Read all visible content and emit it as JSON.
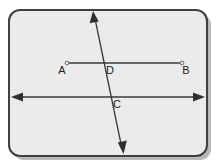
{
  "figure": {
    "kind": "geometry-diagram",
    "background_color": "#ffffff",
    "plate_fill": "#ebebeb",
    "plate_border_color": "#3f3f3f",
    "shadow_color": "#b9b9b9",
    "line_color": "#3a3a3a",
    "arrow_fill": "#2f2f2f",
    "label_color": "#1b1b1b"
  },
  "labels": {
    "a": "A",
    "b": "B",
    "c": "C",
    "d": "D"
  },
  "elements": {
    "segment_ab_name": "segment-AB",
    "line_through_c_name": "horizontal-double-arrow-line",
    "transversal_name": "diagonal-transversal-line"
  }
}
